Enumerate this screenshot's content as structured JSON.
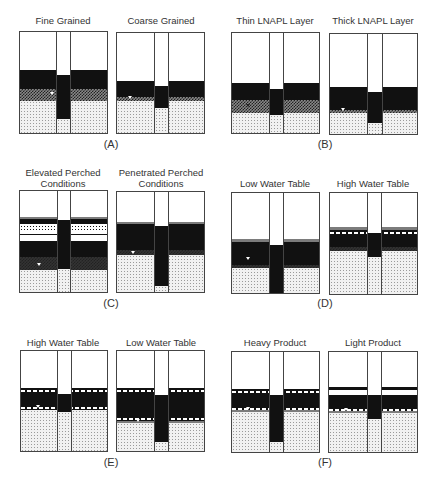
{
  "figure": {
    "groups": [
      {
        "id": "A",
        "caption": "(A)",
        "panels": [
          {
            "title": "Fine Grained"
          },
          {
            "title": "Coarse Grained"
          }
        ]
      },
      {
        "id": "B",
        "caption": "(B)",
        "panels": [
          {
            "title": "Thin LNAPL Layer"
          },
          {
            "title": "Thick LNAPL Layer"
          }
        ]
      },
      {
        "id": "C",
        "caption": "(C)",
        "panels": [
          {
            "title": "Elevated Perched Conditions"
          },
          {
            "title": "Penetrated Perched Conditions"
          }
        ]
      },
      {
        "id": "D",
        "caption": "(D)",
        "panels": [
          {
            "title": "Low Water Table"
          },
          {
            "title": "High Water Table"
          }
        ]
      },
      {
        "id": "E",
        "caption": "(E)",
        "panels": [
          {
            "title": "High Water Table"
          },
          {
            "title": "Low Water Table"
          }
        ]
      },
      {
        "id": "F",
        "caption": "(F)",
        "panels": [
          {
            "title": "Heavy Product"
          },
          {
            "title": "Light Product"
          }
        ]
      }
    ],
    "legend_semantics": {
      "white": "vadose zone (unsaturated soil)",
      "black": "free-phase LNAPL",
      "checkered": "capillary fringe / residual LNAPL",
      "dotted": "water-saturated soil",
      "center_column": "monitoring well",
      "triangle": "water table marker"
    },
    "colors": {
      "line": "#444444",
      "lnapl": "#111111",
      "background": "#ffffff"
    }
  }
}
